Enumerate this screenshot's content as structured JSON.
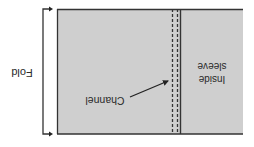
{
  "diagram": {
    "orientation": "rotated-180",
    "labels": {
      "fold": "Fold",
      "channel": "Channel",
      "inside_line1": "Inside",
      "inside_line2": "sleeve"
    },
    "colors": {
      "fabric_fill": "#cfcfcf",
      "line": "#333333",
      "background": "#ffffff"
    }
  }
}
